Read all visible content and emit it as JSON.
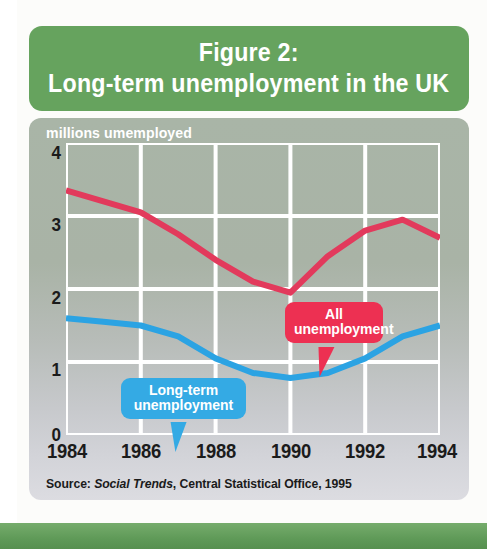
{
  "figure": {
    "title_line1": "Figure 2:",
    "title_line2": "Long-term unemployment in the UK",
    "banner_color": "#66a35e",
    "panel_color": "#b0b7ae"
  },
  "source": {
    "prefix": "Source: ",
    "italic": "Social Trends",
    "suffix": ", Central Statistical Office, 1995"
  },
  "callouts": {
    "all": {
      "line1": "All",
      "line2": "unemployment",
      "color": "#ed3052"
    },
    "long_term": {
      "line1": "Long-term",
      "line2": "unemployment",
      "color": "#34aae4"
    }
  },
  "chart_data": {
    "type": "line",
    "title": "Long-term unemployment in the UK",
    "subtitle": "Figure 2:",
    "xlabel": "",
    "ylabel": "millions umemployed",
    "xlim": [
      1984,
      1994
    ],
    "ylim": [
      0,
      4
    ],
    "yticks": [
      "0",
      "1",
      "2",
      "3",
      "4"
    ],
    "xticks": [
      "1984",
      "1986",
      "1988",
      "1990",
      "1992",
      "1994"
    ],
    "grid": true,
    "grid_color": "#ffffff",
    "legend": "callouts",
    "x": [
      1984,
      1985,
      1986,
      1987,
      1988,
      1989,
      1990,
      1991,
      1992,
      1993,
      1994
    ],
    "series": [
      {
        "name": "All unemployment",
        "color": "#e23a5c",
        "values": [
          3.35,
          3.2,
          3.05,
          2.75,
          2.4,
          2.1,
          1.95,
          2.45,
          2.8,
          2.95,
          2.7
        ]
      },
      {
        "name": "Long-term unemployment",
        "color": "#2ba3e3",
        "values": [
          1.6,
          1.55,
          1.5,
          1.35,
          1.05,
          0.85,
          0.78,
          0.85,
          1.05,
          1.35,
          1.5
        ]
      }
    ],
    "annotations": [
      {
        "text": "All unemployment",
        "x": 1990.6,
        "y": 3.2
      },
      {
        "text": "Long-term unemployment",
        "x": 1985.6,
        "y": 2.2
      }
    ]
  }
}
